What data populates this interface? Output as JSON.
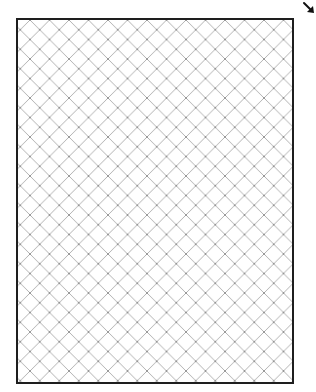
{
  "canvas": {
    "width": 316,
    "height": 392,
    "background": "#ffffff"
  },
  "frame": {
    "x": 16,
    "y": 18,
    "width": 278,
    "height": 366,
    "border_color": "#1e1e1e",
    "border_width": 2
  },
  "hatch": {
    "pattern": "diagonal-crosshatch",
    "angle_deg": 45,
    "spacing_px": 19.5,
    "line_color": "#a8a8a8",
    "intersection_color": "#8a8a8a"
  },
  "corner_arrow": {
    "icon": "arrow-down-right-icon",
    "glyph": "↘",
    "color": "#111111"
  }
}
